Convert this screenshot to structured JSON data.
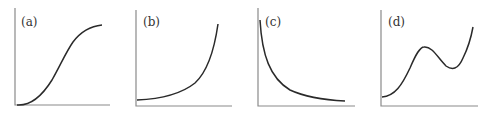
{
  "panels": [
    {
      "id": "a",
      "label": "(a)",
      "shape": "sigmoid / S-shaped increasing curve that levels off"
    },
    {
      "id": "b",
      "label": "(b)",
      "shape": "exponential growth starting above zero"
    },
    {
      "id": "c",
      "label": "(c)",
      "shape": "decreasing hyperbolic decay curve"
    },
    {
      "id": "d",
      "label": "(d)",
      "shape": "cubic-like curve: rise, local max, local min, rise"
    }
  ],
  "colors": {
    "axis": "#8a8a8a",
    "curve": "#2a2a2a",
    "background": "#ffffff"
  }
}
